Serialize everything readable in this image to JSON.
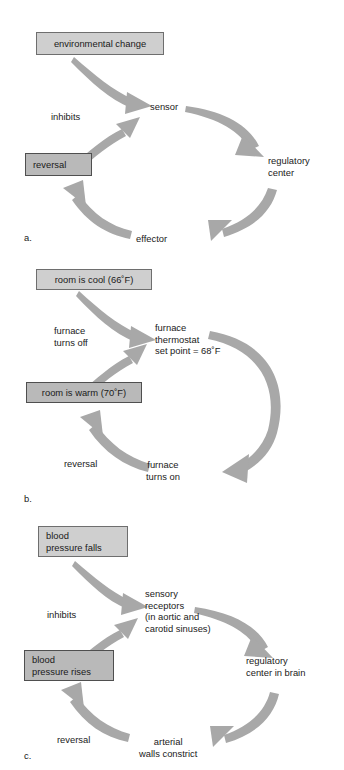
{
  "figure": {
    "type": "diagram",
    "colors": {
      "box_fill_light": "#cfcfcf",
      "box_fill_dark": "#b9b9b9",
      "box_border": "#6e6e6e",
      "box_border_dark": "#4f4f4f",
      "arrow_fill": "#a8a8a8",
      "text": "#1a1a1a",
      "background": "#ffffff"
    }
  },
  "panels": [
    {
      "letter": "a.",
      "nodes": {
        "stimulus": "environmental change",
        "sensor": "sensor",
        "regulatory_center": "regulatory\ncenter",
        "effector": "effector",
        "reversal_box": "reversal"
      },
      "edge_labels": {
        "inhibits": "inhibits"
      }
    },
    {
      "letter": "b.",
      "nodes": {
        "stimulus": "room is cool (66˚F)",
        "sensor": "furnace\nthermostat\nset point = 68˚F",
        "effector": "furnace\nturns on",
        "reversal_box": "room is warm (70˚F)"
      },
      "edge_labels": {
        "inhibits": "furnace\nturns off",
        "reversal": "reversal"
      }
    },
    {
      "letter": "c.",
      "nodes": {
        "stimulus": "blood\npressure falls",
        "sensor": "sensory\nreceptors\n(in aortic and\ncarotid sinuses)",
        "regulatory_center": "regulatory\ncenter in brain",
        "effector": "arterial\nwalls constrict",
        "reversal_box": "blood\npressure rises"
      },
      "edge_labels": {
        "inhibits": "inhibits",
        "reversal": "reversal"
      }
    }
  ]
}
